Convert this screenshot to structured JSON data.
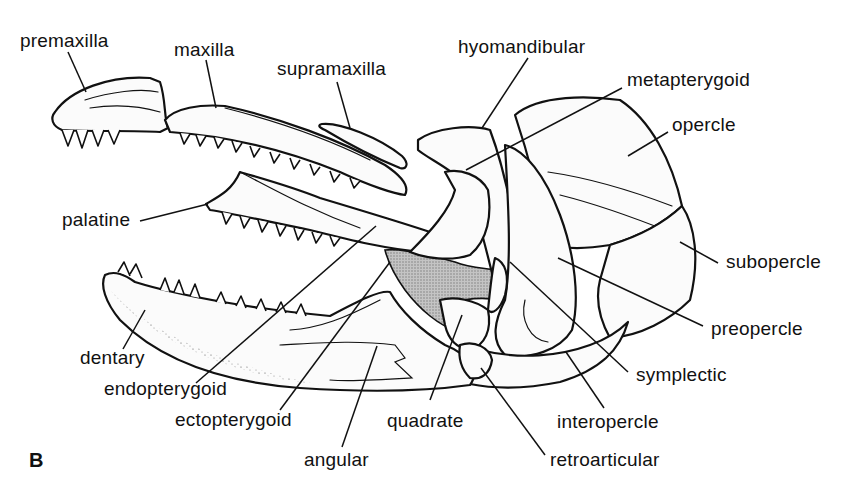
{
  "figure": {
    "panel_letter": "B",
    "labels": {
      "premaxilla": "premaxilla",
      "maxilla": "maxilla",
      "supramaxilla": "supramaxilla",
      "hyomandibular": "hyomandibular",
      "metapterygoid": "metapterygoid",
      "opercle": "opercle",
      "palatine": "palatine",
      "subopercle": "subopercle",
      "preopercle": "preopercle",
      "dentary": "dentary",
      "endopterygoid": "endopterygoid",
      "symplectic": "symplectic",
      "ectopterygoid": "ectopterygoid",
      "quadrate": "quadrate",
      "interopercle": "interopercle",
      "angular": "angular",
      "retroarticular": "retroarticular"
    },
    "colors": {
      "ink": "#111111",
      "background": "#ffffff",
      "shaded_region": "#b8b8b8"
    }
  }
}
